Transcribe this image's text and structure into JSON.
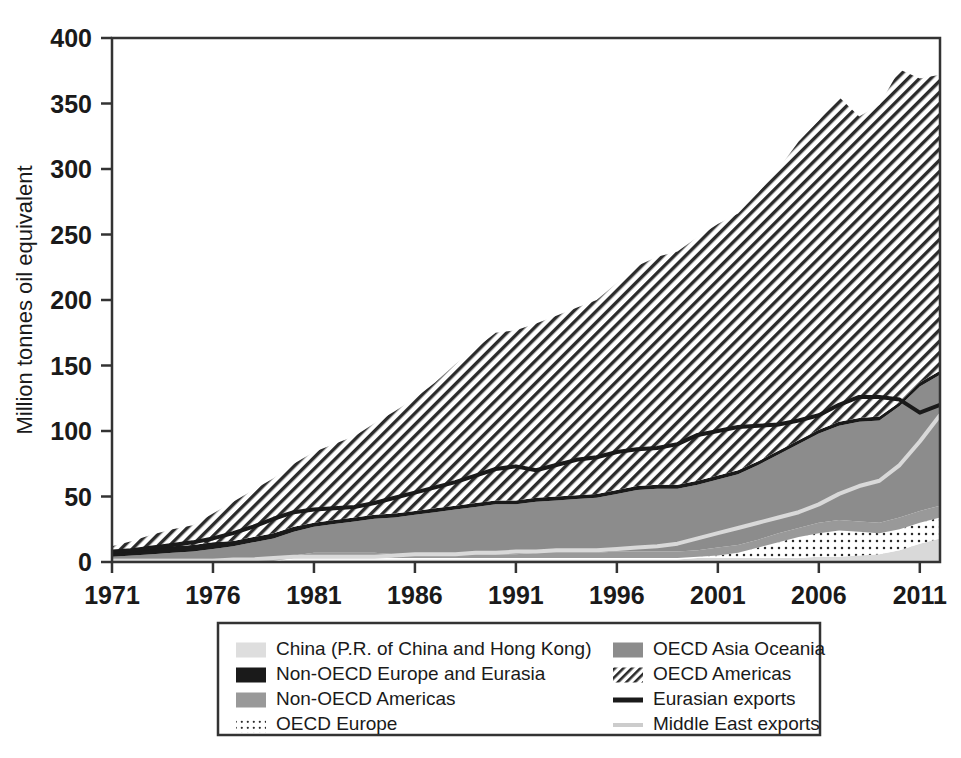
{
  "chart_data": {
    "type": "area",
    "title": "",
    "xlabel": "",
    "ylabel": "Million tonnes oil equivalent",
    "ylim": [
      0,
      400
    ],
    "xlim": [
      1971,
      2012
    ],
    "y_ticks": [
      0,
      50,
      100,
      150,
      200,
      250,
      300,
      350,
      400
    ],
    "x_ticks": [
      1971,
      1976,
      1981,
      1986,
      1991,
      1996,
      2001,
      2006,
      2011
    ],
    "grid": false,
    "legend_position": "bottom",
    "stack_order": [
      "China (P.R. of China and Hong Kong)",
      "OECD Europe",
      "Non-OECD Americas",
      "OECD Asia Oceania",
      "Non-OECD Europe and Eurasia",
      "OECD Americas"
    ],
    "x": [
      1971,
      1972,
      1973,
      1974,
      1975,
      1976,
      1977,
      1978,
      1979,
      1980,
      1981,
      1982,
      1983,
      1984,
      1985,
      1986,
      1987,
      1988,
      1989,
      1990,
      1991,
      1992,
      1993,
      1994,
      1995,
      1996,
      1997,
      1998,
      1999,
      2000,
      2001,
      2002,
      2003,
      2004,
      2005,
      2006,
      2007,
      2008,
      2009,
      2010,
      2011,
      2012
    ],
    "series": [
      {
        "name": "China (P.R. of China and Hong Kong)",
        "fill": "#d9d9d9",
        "pattern": "solid",
        "values": [
          1,
          1,
          1,
          1,
          1,
          1,
          1,
          1,
          1,
          2,
          2,
          2,
          2,
          2,
          2,
          2,
          2,
          2,
          2,
          2,
          2,
          2,
          2,
          2,
          2,
          2,
          2,
          2,
          2,
          3,
          3,
          3,
          3,
          3,
          3,
          4,
          4,
          5,
          6,
          9,
          14,
          18
        ]
      },
      {
        "name": "OECD Europe",
        "fill": "#ffffff",
        "pattern": "dots",
        "values": [
          0,
          0,
          0,
          0,
          0,
          0,
          0,
          0,
          0,
          1,
          2,
          2,
          2,
          2,
          1,
          1,
          1,
          1,
          1,
          1,
          1,
          1,
          1,
          1,
          1,
          1,
          1,
          1,
          1,
          1,
          2,
          4,
          8,
          12,
          16,
          18,
          20,
          18,
          16,
          16,
          16,
          16
        ]
      },
      {
        "name": "Non-OECD Americas",
        "fill": "#999999",
        "pattern": "solid",
        "values": [
          2,
          2,
          2,
          2,
          2,
          2,
          2,
          2,
          2,
          2,
          3,
          3,
          3,
          3,
          3,
          3,
          3,
          3,
          3,
          3,
          3,
          4,
          4,
          4,
          4,
          5,
          5,
          5,
          5,
          5,
          6,
          6,
          6,
          7,
          7,
          8,
          8,
          8,
          8,
          9,
          9,
          9
        ]
      },
      {
        "name": "OECD Asia Oceania",
        "fill": "#8c8c8c",
        "pattern": "solid",
        "values": [
          1,
          2,
          3,
          4,
          5,
          7,
          9,
          12,
          15,
          18,
          20,
          22,
          24,
          26,
          28,
          30,
          32,
          34,
          36,
          38,
          38,
          39,
          40,
          41,
          42,
          44,
          47,
          48,
          48,
          50,
          52,
          54,
          57,
          60,
          64,
          68,
          72,
          76,
          78,
          85,
          95,
          100
        ]
      },
      {
        "name": "Non-OECD Europe and Eurasia",
        "fill": "#1a1a1a",
        "pattern": "solid",
        "values": [
          5,
          5,
          5,
          5,
          5,
          5,
          4,
          4,
          4,
          4,
          3,
          3,
          3,
          3,
          3,
          3,
          3,
          3,
          3,
          3,
          3,
          3,
          3,
          3,
          3,
          3,
          3,
          3,
          3,
          3,
          3,
          3,
          3,
          3,
          3,
          3,
          3,
          3,
          3,
          3,
          3,
          3
        ]
      },
      {
        "name": "OECD Americas",
        "fill": "#ffffff",
        "pattern": "diagonal",
        "values": [
          3,
          6,
          10,
          13,
          15,
          22,
          30,
          36,
          42,
          48,
          54,
          58,
          62,
          70,
          78,
          86,
          96,
          108,
          118,
          128,
          130,
          133,
          138,
          143,
          148,
          158,
          168,
          174,
          178,
          186,
          192,
          196,
          205,
          215,
          228,
          236,
          248,
          230,
          238,
          254,
          232,
          226
        ]
      }
    ],
    "lines": [
      {
        "name": "Eurasian exports",
        "color": "#1a1a1a",
        "width": 4,
        "values": [
          8,
          9,
          11,
          13,
          15,
          18,
          22,
          27,
          33,
          38,
          40,
          41,
          42,
          45,
          49,
          53,
          57,
          61,
          66,
          71,
          73,
          70,
          74,
          78,
          80,
          84,
          86,
          87,
          90,
          97,
          100,
          103,
          104,
          105,
          108,
          112,
          120,
          126,
          126,
          124,
          114,
          120
        ]
      },
      {
        "name": "Middle East exports",
        "color": "#d9d9d9",
        "width": 4,
        "values": [
          1,
          1,
          1,
          1,
          1,
          1,
          2,
          2,
          3,
          4,
          4,
          4,
          4,
          4,
          5,
          6,
          6,
          6,
          7,
          7,
          8,
          8,
          9,
          9,
          9,
          10,
          11,
          12,
          14,
          18,
          22,
          26,
          30,
          34,
          38,
          44,
          52,
          58,
          62,
          74,
          92,
          112
        ]
      }
    ]
  },
  "axes": {
    "y_title": "Million tonnes oil equivalent",
    "y_labels": [
      "400",
      "350",
      "300",
      "250",
      "200",
      "150",
      "100",
      "50",
      "0"
    ],
    "x_labels": [
      "1971",
      "1976",
      "1981",
      "1986",
      "1991",
      "1996",
      "2001",
      "2006",
      "2011"
    ]
  },
  "legend": {
    "column_left": [
      {
        "label": "China (P.R. of China and Hong Kong)",
        "swatch": "swatch-china",
        "style": "light-gray-fill"
      },
      {
        "label": "Non-OECD Europe and Eurasia",
        "swatch": "swatch-non-oecd-europe",
        "style": "black-fill"
      },
      {
        "label": "Non-OECD Americas",
        "swatch": "swatch-non-oecd-americas",
        "style": "gray-fill"
      },
      {
        "label": "OECD Europe",
        "swatch": "swatch-oecd-europe",
        "style": "dotted-fill"
      }
    ],
    "column_right": [
      {
        "label": "OECD Asia Oceania",
        "swatch": "swatch-oecd-asia-oceania",
        "style": "dark-gray-fill"
      },
      {
        "label": "OECD Americas",
        "swatch": "swatch-oecd-americas",
        "style": "diagonal-hatch"
      },
      {
        "label": "Eurasian exports",
        "swatch": "swatch-eurasian-exports",
        "style": "black-line"
      },
      {
        "label": "Middle East exports",
        "swatch": "swatch-middle-east-exports",
        "style": "light-gray-line"
      }
    ]
  },
  "colors": {
    "china": "#d9d9d9",
    "non_oecd_europe": "#1a1a1a",
    "non_oecd_americas": "#999999",
    "oecd_asia_oceania": "#8c8c8c",
    "oecd_americas_hatch": "#333333",
    "eurasian_exports_line": "#1a1a1a",
    "middle_east_exports_line": "#d9d9d9",
    "axis": "#333333",
    "text": "#1a1a1a"
  }
}
